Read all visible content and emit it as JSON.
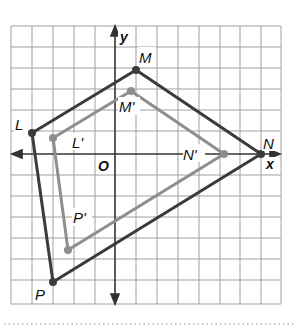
{
  "figure": {
    "axes": {
      "x_label": "x",
      "y_label": "y",
      "origin_label": "O"
    },
    "colors": {
      "original": "#3b3b3b",
      "image": "#8e8e8e",
      "grid": "#9a9a9a",
      "axis": "#333333"
    },
    "polygons": {
      "original": {
        "name": "LMNP",
        "vertices": [
          {
            "label": "L",
            "grid": [
              -4,
              1
            ]
          },
          {
            "label": "M",
            "grid": [
              1,
              4
            ]
          },
          {
            "label": "N",
            "grid": [
              7,
              0
            ]
          },
          {
            "label": "P",
            "grid": [
              -3,
              -6
            ]
          }
        ]
      },
      "image": {
        "name": "L'M'N'P'",
        "vertices": [
          {
            "label": "L'",
            "grid": [
              -3,
              0.75
            ]
          },
          {
            "label": "M'",
            "grid": [
              0.75,
              3
            ]
          },
          {
            "label": "N'",
            "grid": [
              5.25,
              0
            ]
          },
          {
            "label": "P'",
            "grid": [
              -2.25,
              -4.5
            ]
          }
        ]
      }
    }
  }
}
